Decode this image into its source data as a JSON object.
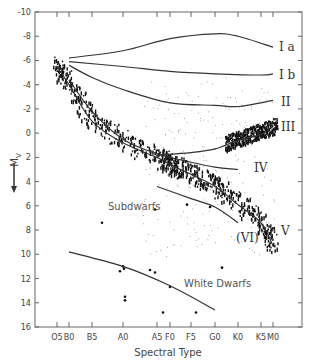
{
  "chart_data": {
    "type": "scatter",
    "title": "",
    "xlabel": "Spectral Type",
    "ylabel": "M_V",
    "ylim": [
      -10,
      16
    ],
    "y_inverted": true,
    "yticks": [
      -10,
      -8,
      -6,
      -4,
      -2,
      0,
      2,
      4,
      6,
      8,
      10,
      12,
      14,
      16
    ],
    "ytick_labels": [
      "-10",
      "-8",
      "-6",
      "-4",
      "-2",
      "0",
      "2",
      "4",
      "6",
      "8",
      "10",
      "12",
      "14",
      "16"
    ],
    "categories": [
      "O5",
      "B0",
      "B5",
      "A0",
      "A5",
      "F0",
      "F5",
      "G0",
      "K0",
      "K5",
      "M0"
    ],
    "grid": false,
    "legend": null,
    "series": [
      {
        "name": "Ia",
        "type": "line",
        "points": [
          [
            "B0",
            -6.2
          ],
          [
            "A0",
            -6.8
          ],
          [
            "F0",
            -7.8
          ],
          [
            "G0",
            -8.2
          ],
          [
            "K0",
            -8.0
          ],
          [
            "M0",
            -7.1
          ]
        ]
      },
      {
        "name": "Ib",
        "type": "line",
        "points": [
          [
            "B0",
            -5.9
          ],
          [
            "A0",
            -5.5
          ],
          [
            "F0",
            -5.1
          ],
          [
            "G0",
            -4.9
          ],
          [
            "K5",
            -4.8
          ],
          [
            "M0",
            -4.9
          ]
        ]
      },
      {
        "name": "II",
        "type": "line",
        "points": [
          [
            "B0",
            -5.6
          ],
          [
            "B5",
            -4.6
          ],
          [
            "A0",
            -3.6
          ],
          [
            "F0",
            -2.5
          ],
          [
            "G0",
            -2.3
          ],
          [
            "K0",
            -2.2
          ],
          [
            "M0",
            -2.7
          ]
        ]
      },
      {
        "name": "III",
        "type": "line",
        "points": [
          [
            "A5",
            1.8
          ],
          [
            "F5",
            1.6
          ],
          [
            "G0",
            1.3
          ],
          [
            "K0",
            0.6
          ],
          [
            "K5",
            0.1
          ],
          [
            "M0",
            -0.6
          ]
        ]
      },
      {
        "name": "IV",
        "type": "line",
        "points": [
          [
            "B0",
            -4.4
          ],
          [
            "B5",
            -1.8
          ],
          [
            "A0",
            0.5
          ],
          [
            "A5",
            1.7
          ],
          [
            "F5",
            2.4
          ],
          [
            "G0",
            2.8
          ],
          [
            "K0",
            3.0
          ]
        ]
      },
      {
        "name": "V",
        "type": "line",
        "points": [
          [
            "O5",
            -5.5
          ],
          [
            "B0",
            -4.0
          ],
          [
            "B5",
            -1.0
          ],
          [
            "A0",
            0.8
          ],
          [
            "A5",
            2.0
          ],
          [
            "F0",
            2.6
          ],
          [
            "F5",
            3.4
          ],
          [
            "G0",
            4.4
          ],
          [
            "K0",
            5.9
          ],
          [
            "K5",
            7.4
          ],
          [
            "M0",
            9.3
          ]
        ]
      },
      {
        "name": "(VI)",
        "type": "line",
        "points": [
          [
            "A5",
            4.4
          ],
          [
            "F5",
            5.4
          ],
          [
            "G0",
            6.1
          ],
          [
            "K0",
            7.4
          ]
        ]
      },
      {
        "name": "White Dwarfs",
        "type": "line",
        "points": [
          [
            "B0",
            9.8
          ],
          [
            "A0",
            11.0
          ],
          [
            "F0",
            12.6
          ],
          [
            "G0",
            14.6
          ]
        ]
      }
    ],
    "annotations": [
      "Ia",
      "Ib",
      "II",
      "III",
      "IV",
      "V",
      "(VI)",
      "Subdwarfs",
      "White Dwarfs"
    ]
  },
  "labels": {
    "x_title": "Spectral Type",
    "y_title": "M",
    "y_title_sub": "V",
    "lum": {
      "Ia": "I a",
      "Ib": "I b",
      "II": "II",
      "III": "III",
      "IV": "IV",
      "V": "V",
      "VI": "(VI)"
    },
    "subdwarfs": "Subdwarfs",
    "white_dwarfs": "White Dwarfs"
  }
}
